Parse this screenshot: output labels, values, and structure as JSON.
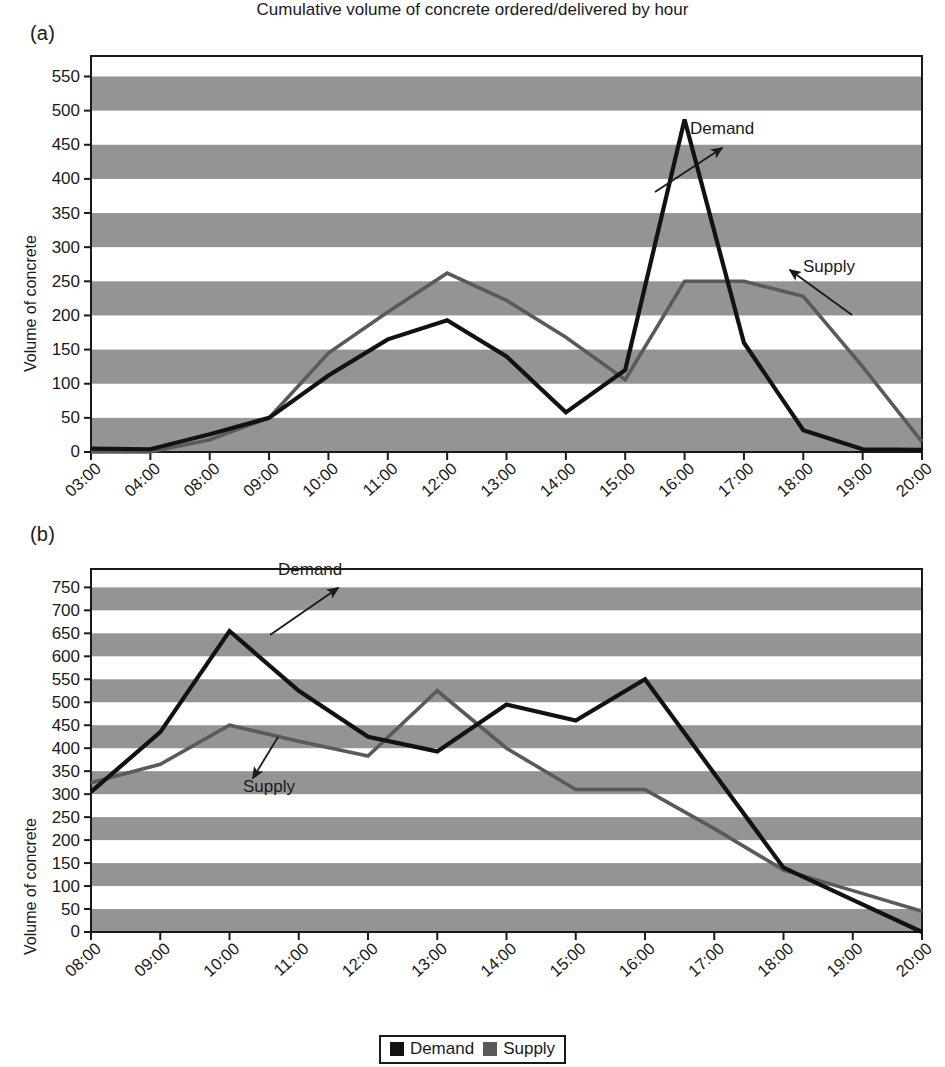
{
  "figure": {
    "panels": [
      {
        "tag": "(a)",
        "ylabel": "Volume of concrete",
        "annotation_demand": "Demand",
        "annotation_supply": "Supply"
      },
      {
        "tag": "(b)",
        "ylabel": "Volume of concrete",
        "annotation_demand": "Demand",
        "annotation_supply": "Supply"
      }
    ],
    "xaxis_title": "Cumulative volume of concrete ordered/delivered by hour",
    "legend": {
      "items": [
        {
          "label": "Demand",
          "color": "#121212"
        },
        {
          "label": "Supply",
          "color": "#5a5a5a"
        }
      ]
    },
    "colors": {
      "demand": "#121212",
      "supply": "#5a5a5a",
      "band": "#949494",
      "axis": "#1a1a1a",
      "background": "#ffffff"
    }
  },
  "chart_data": [
    {
      "type": "line",
      "title": "(a)",
      "xlabel": "",
      "ylabel": "Volume of concrete",
      "categories": [
        "03:00",
        "04:00",
        "08:00",
        "09:00",
        "10:00",
        "11:00",
        "12:00",
        "13:00",
        "14:00",
        "15:00",
        "16:00",
        "17:00",
        "18:00",
        "19:00",
        "20:00"
      ],
      "ylim": [
        0,
        580
      ],
      "yticks": [
        0,
        50,
        100,
        150,
        200,
        250,
        300,
        350,
        400,
        450,
        500,
        550
      ],
      "grid": "banded-horizontal",
      "legend_position": "bottom-center",
      "series": [
        {
          "name": "Demand",
          "color": "#121212",
          "values": [
            5,
            4,
            26,
            50,
            112,
            165,
            193,
            140,
            58,
            120,
            487,
            160,
            32,
            4,
            3
          ]
        },
        {
          "name": "Supply",
          "color": "#5a5a5a",
          "values": [
            0,
            0,
            18,
            50,
            145,
            205,
            262,
            222,
            168,
            106,
            250,
            250,
            228,
            125,
            15
          ]
        }
      ],
      "annotations": [
        {
          "text": "Demand",
          "points_to_series": "Demand"
        },
        {
          "text": "Supply",
          "points_to_series": "Supply"
        }
      ]
    },
    {
      "type": "line",
      "title": "(b)",
      "xlabel": "Cumulative volume of concrete ordered/delivered by hour",
      "ylabel": "Volume of concrete",
      "categories": [
        "08:00",
        "09:00",
        "10:00",
        "11:00",
        "12:00",
        "13:00",
        "14:00",
        "15:00",
        "16:00",
        "17:00",
        "18:00",
        "19:00",
        "20:00"
      ],
      "ylim": [
        0,
        790
      ],
      "yticks": [
        0,
        50,
        100,
        150,
        200,
        250,
        300,
        350,
        400,
        450,
        500,
        550,
        600,
        650,
        700,
        750
      ],
      "grid": "banded-horizontal",
      "legend_position": "bottom-center",
      "series": [
        {
          "name": "Demand",
          "color": "#121212",
          "values": [
            305,
            435,
            655,
            525,
            425,
            393,
            495,
            460,
            550,
            345,
            140,
            70,
            0
          ]
        },
        {
          "name": "Supply",
          "color": "#5a5a5a",
          "values": [
            325,
            365,
            450,
            415,
            383,
            525,
            400,
            310,
            310,
            225,
            135,
            90,
            45
          ]
        }
      ],
      "annotations": [
        {
          "text": "Demand",
          "points_to_series": "Demand"
        },
        {
          "text": "Supply",
          "points_to_series": "Supply"
        }
      ]
    }
  ]
}
